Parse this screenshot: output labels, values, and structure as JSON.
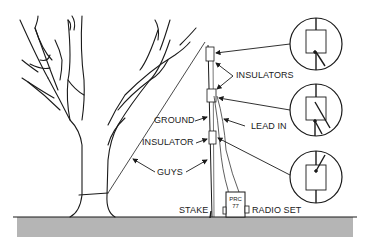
{
  "diagram": {
    "type": "antenna-installation",
    "labels": {
      "insulators": "INSULATORS",
      "lead_in": "LEAD IN",
      "ground": "GROUND",
      "insulator": "INSULATOR",
      "guys": "GUYS",
      "stake": "STAKE",
      "radio_set": "RADIO SET"
    },
    "radio": {
      "model_line1": "PRC",
      "model_line2": "77"
    },
    "details": [
      {
        "name": "top-insulator-detail"
      },
      {
        "name": "middle-insulator-detail"
      },
      {
        "name": "lower-insulator-detail"
      }
    ],
    "colors": {
      "line": "#1a1a1a",
      "ground_fill": "#b5b5b5",
      "background": "#ffffff"
    }
  }
}
